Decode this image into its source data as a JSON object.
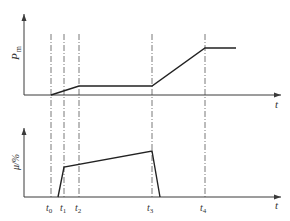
{
  "upper_plot": {
    "ylabel": "P",
    "ylabel_sub": "m",
    "xlabel": "t",
    "curve_points": [
      [
        51,
        95
      ],
      [
        79,
        86
      ],
      [
        152,
        86
      ],
      [
        205,
        48
      ],
      [
        236,
        48
      ]
    ]
  },
  "lower_plot": {
    "ylabel": "μ/%",
    "xlabel": "t",
    "curve_points": [
      [
        58,
        197
      ],
      [
        64,
        167
      ],
      [
        152,
        151
      ],
      [
        160,
        197
      ]
    ]
  },
  "time_markers": [
    {
      "label": "t",
      "sub": "0",
      "x": 51
    },
    {
      "label": "t",
      "sub": "1",
      "x": 64
    },
    {
      "label": "t",
      "sub": "2",
      "x": 79
    },
    {
      "label": "t",
      "sub": "3",
      "x": 152
    },
    {
      "label": "t",
      "sub": "4",
      "x": 205
    }
  ],
  "colors": {
    "line": "#222222",
    "axis": "#3a3a3a",
    "guide": "#555555"
  }
}
